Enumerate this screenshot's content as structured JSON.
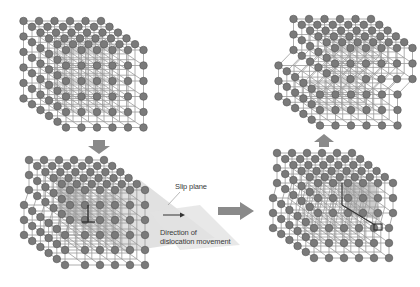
{
  "diagram": {
    "type": "edge-dislocation-slip",
    "panels": [
      {
        "id": "top-left",
        "label": "",
        "description": "perfect cubic crystal lattice"
      },
      {
        "id": "bottom-left",
        "label": "",
        "description": "crystal with edge dislocation and slip plane"
      },
      {
        "id": "bottom-right",
        "label": "",
        "description": "dislocation moved along slip plane"
      },
      {
        "id": "top-right",
        "label": "",
        "description": "crystal after slip (step formed)"
      }
    ],
    "labels": {
      "slip_plane": "Slip plane",
      "direction_line1": "Direction of",
      "direction_line2": "dislocation movement"
    },
    "arrows": [
      {
        "name": "down-arrow",
        "from": "top-left",
        "to": "bottom-left"
      },
      {
        "name": "right-arrow",
        "from": "bottom-left",
        "to": "bottom-right"
      },
      {
        "name": "up-arrow",
        "from": "bottom-right",
        "to": "top-right"
      }
    ],
    "colors": {
      "atom": "#7a7a7a",
      "atom_stroke": "#555555",
      "bond": "#9a9a9a",
      "slip_plane": "#d6d6d6",
      "shaded_region": "#c4c4c4",
      "arrow": "#8a8a8a",
      "dislocation_symbol": "#333333"
    }
  }
}
